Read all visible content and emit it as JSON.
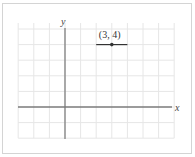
{
  "chart_data": {
    "type": "scatter",
    "title": "",
    "xlabel": "x",
    "ylabel": "y",
    "xlim": [
      -3,
      7
    ],
    "ylim": [
      -2,
      5
    ],
    "grid": true,
    "legend": null,
    "points": [
      {
        "x": 3,
        "y": 4,
        "label": "(3, 4)"
      }
    ],
    "segments": [
      {
        "x1": 2,
        "y1": 4,
        "x2": 4,
        "y2": 4,
        "note": "horizontal segment through the point"
      }
    ]
  },
  "labels": {
    "x_axis": "x",
    "y_axis": "y",
    "point": "(3, 4)"
  },
  "colors": {
    "grid": "#e6e6e6",
    "axis": "#444444",
    "point": "#333333",
    "frame": "#d4d4d4"
  }
}
